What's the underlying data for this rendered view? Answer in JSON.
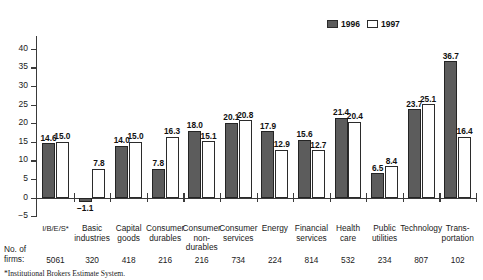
{
  "chart_data": {
    "type": "bar",
    "title": "",
    "xlabel": "",
    "ylabel": "",
    "ylim": [
      -5,
      40
    ],
    "yticks": [
      40,
      35,
      30,
      25,
      20,
      15,
      10,
      5,
      0,
      -5
    ],
    "ytick_labels": [
      "40",
      "35",
      "30",
      "25",
      "20",
      "15",
      "10",
      "5",
      "0",
      "−5"
    ],
    "grid": false,
    "legend_position": "top-right",
    "categories": [
      "I/B/E/S*",
      "Basic industries",
      "Capital goods",
      "Consumer durables",
      "Consumer non-durables",
      "Consumer services",
      "Energy",
      "Financial services",
      "Health care",
      "Public utilities",
      "Technology",
      "Transportation"
    ],
    "category_lines": [
      [
        "I/B/E/S*"
      ],
      [
        "Basic",
        "industries"
      ],
      [
        "Capital",
        "goods"
      ],
      [
        "Consumer",
        "durables"
      ],
      [
        "Consumer",
        "non-",
        "durables"
      ],
      [
        "Consumer",
        "services"
      ],
      [
        "Energy"
      ],
      [
        "Financial",
        "services"
      ],
      [
        "Health",
        "care"
      ],
      [
        "Public",
        "utilities"
      ],
      [
        "Technology"
      ],
      [
        "Trans-",
        "portation"
      ]
    ],
    "series": [
      {
        "name": "1996",
        "color": "#5c5c5c",
        "values": [
          14.6,
          -1.1,
          14.0,
          7.8,
          18.0,
          20.1,
          17.9,
          15.6,
          21.4,
          6.5,
          23.7,
          36.7
        ],
        "labels": [
          "14.6",
          "−1.1",
          "14.0",
          "7.8",
          "18.0",
          "20.1",
          "17.9",
          "15.6",
          "21.4",
          "6.5",
          "23.7",
          "36.7"
        ]
      },
      {
        "name": "1997",
        "color": "#ffffff",
        "values": [
          15.0,
          7.8,
          15.0,
          16.3,
          15.1,
          20.8,
          12.9,
          12.7,
          20.4,
          8.4,
          25.1,
          16.4
        ],
        "labels": [
          "15.0",
          "7.8",
          "15.0",
          "16.3",
          "15.1",
          "20.8",
          "12.9",
          "12.7",
          "20.4",
          "8.4",
          "25.1",
          "16.4"
        ]
      }
    ],
    "firms_row": {
      "title_line_1": "No. of",
      "title_line_2": "firms:",
      "values": [
        "5061",
        "320",
        "418",
        "216",
        "216",
        "734",
        "224",
        "814",
        "532",
        "234",
        "807",
        "102"
      ]
    },
    "footnote": "*Institutional Brokers Estimate System."
  }
}
